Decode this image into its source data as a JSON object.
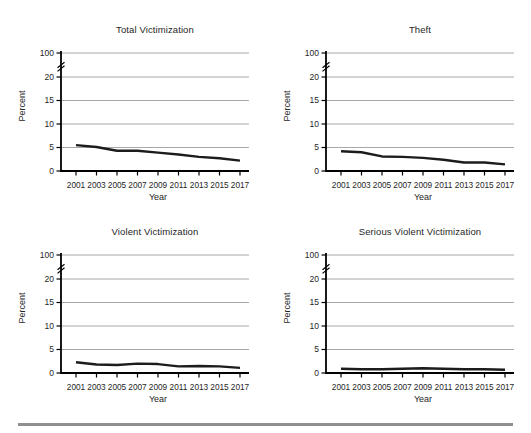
{
  "page": {
    "background": "#ffffff",
    "divider_color": "#8f8f8f"
  },
  "chart_style": {
    "line_color": "#1c1c1c",
    "grid_color": "#a8a8a8",
    "axis_color": "#000000",
    "text_color": "#262626"
  },
  "chart_data": [
    {
      "type": "line",
      "title": "Total Victimization",
      "xlabel": "Year",
      "ylabel": "Percent",
      "x": [
        2001,
        2003,
        2005,
        2007,
        2009,
        2011,
        2013,
        2015,
        2017
      ],
      "values": [
        5.5,
        5.1,
        4.3,
        4.3,
        3.9,
        3.5,
        3.0,
        2.7,
        2.2
      ],
      "y_ticks": [
        0,
        5,
        10,
        15,
        20,
        100
      ],
      "y_axis_break_after": 20,
      "grid": true,
      "legend": false
    },
    {
      "type": "line",
      "title": "Theft",
      "xlabel": "Year",
      "ylabel": "Percent",
      "x": [
        2001,
        2003,
        2005,
        2007,
        2009,
        2011,
        2013,
        2015,
        2017
      ],
      "values": [
        4.2,
        4.0,
        3.1,
        3.0,
        2.8,
        2.4,
        1.8,
        1.8,
        1.4
      ],
      "y_ticks": [
        0,
        5,
        10,
        15,
        20,
        100
      ],
      "y_axis_break_after": 20,
      "grid": true,
      "legend": false
    },
    {
      "type": "line",
      "title": "Violent Victimization",
      "xlabel": "Year",
      "ylabel": "Percent",
      "x": [
        2001,
        2003,
        2005,
        2007,
        2009,
        2011,
        2013,
        2015,
        2017
      ],
      "values": [
        2.3,
        1.8,
        1.7,
        2.0,
        1.9,
        1.4,
        1.5,
        1.4,
        1.1
      ],
      "y_ticks": [
        0,
        5,
        10,
        15,
        20,
        100
      ],
      "y_axis_break_after": 20,
      "grid": true,
      "legend": false
    },
    {
      "type": "line",
      "title": "Serious Violent Victimization",
      "xlabel": "Year",
      "ylabel": "Percent",
      "x": [
        2001,
        2003,
        2005,
        2007,
        2009,
        2011,
        2013,
        2015,
        2017
      ],
      "values": [
        0.9,
        0.8,
        0.8,
        0.9,
        1.0,
        0.9,
        0.8,
        0.8,
        0.7
      ],
      "y_ticks": [
        0,
        5,
        10,
        15,
        20,
        100
      ],
      "y_axis_break_after": 20,
      "grid": true,
      "legend": false
    }
  ]
}
